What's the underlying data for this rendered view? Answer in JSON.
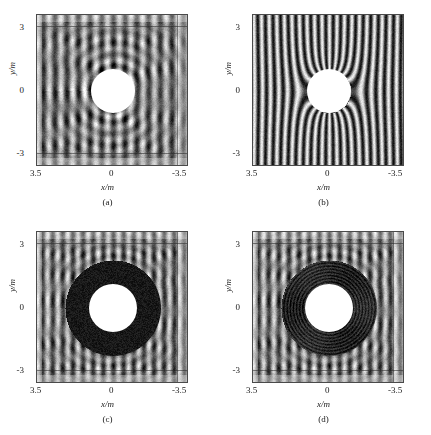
{
  "figure": {
    "panels": [
      {
        "id": "a",
        "caption": "(a)",
        "xlabel": "x/m",
        "ylabel": "y/m",
        "xticks": [
          "3.5",
          "0",
          "-3.5"
        ],
        "yticks": [
          "3",
          "0",
          "-3"
        ],
        "has_shell": false,
        "shell_style": "none",
        "field_style": "standing-wave"
      },
      {
        "id": "b",
        "caption": "(b)",
        "xlabel": "x/m",
        "ylabel": "y/m",
        "xticks": [
          "3.5",
          "0",
          "-3.5"
        ],
        "yticks": [
          "3",
          "0",
          "-3"
        ],
        "has_shell": false,
        "shell_style": "none",
        "field_style": "plane-wave"
      },
      {
        "id": "c",
        "caption": "(c)",
        "xlabel": "x/m",
        "ylabel": "y/m",
        "xticks": [
          "3.5",
          "0",
          "-3.5"
        ],
        "yticks": [
          "3",
          "0",
          "-3"
        ],
        "has_shell": true,
        "shell_style": "solid-dark",
        "field_style": "standing-wave"
      },
      {
        "id": "d",
        "caption": "(d)",
        "xlabel": "x/m",
        "ylabel": "y/m",
        "xticks": [
          "3.5",
          "0",
          "-3.5"
        ],
        "yticks": [
          "3",
          "0",
          "-3"
        ],
        "has_shell": true,
        "shell_style": "layered-dark",
        "field_style": "standing-wave"
      }
    ]
  },
  "chart_data": {
    "type": "heatmap",
    "title": "",
    "xlabel": "x/m",
    "ylabel": "y/m",
    "xlim": [
      3.5,
      -3.5
    ],
    "ylim": [
      -3.5,
      3.5
    ],
    "xticks": [
      3.5,
      0,
      -3.5
    ],
    "xticklabels": [
      "3.5",
      "0",
      "-3.5"
    ],
    "yticks": [
      3,
      0,
      -3
    ],
    "yticklabels": [
      "3",
      "0",
      "-3"
    ],
    "grid": false,
    "legend": "none",
    "colormap": "grayscale",
    "panels": [
      {
        "label": "(a)",
        "scatterer_center": [
          0,
          0
        ],
        "scatterer_radius": 1.0,
        "shell_inner_radius": null,
        "shell_outer_radius": null,
        "wave_periods_across": 13,
        "incident_direction": "left-to-right",
        "field_character": "strong standing wave with shadow and backscatter"
      },
      {
        "label": "(b)",
        "scatterer_center": [
          0,
          0
        ],
        "scatterer_radius": 1.0,
        "shell_inner_radius": null,
        "shell_outer_radius": null,
        "wave_periods_across": 20,
        "incident_direction": "left-to-right",
        "field_character": "near plane wave bending around cylinder"
      },
      {
        "label": "(c)",
        "scatterer_center": [
          0,
          0
        ],
        "scatterer_radius": 1.0,
        "shell_inner_radius": 1.0,
        "shell_outer_radius": 2.1,
        "wave_periods_across": 15,
        "incident_direction": "left-to-right",
        "field_character": "standing wave with homogeneous dark cloaking shell"
      },
      {
        "label": "(d)",
        "scatterer_center": [
          0,
          0
        ],
        "scatterer_radius": 1.0,
        "shell_inner_radius": 1.0,
        "shell_outer_radius": 2.1,
        "wave_periods_across": 15,
        "incident_direction": "left-to-right",
        "field_character": "standing wave with layered dark cloaking shell"
      }
    ]
  }
}
